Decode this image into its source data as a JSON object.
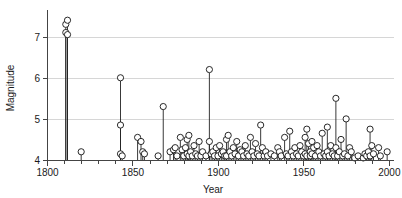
{
  "chart_data": {
    "type": "scatter",
    "plot_style": "stem-lollipop",
    "title": "",
    "xlabel": "Year",
    "ylabel": "Magnitude",
    "xlim": [
      1800,
      2003
    ],
    "ylim": [
      4,
      7.6
    ],
    "grid": "horizontal-only",
    "legend": "none",
    "baseline": 4,
    "x_ticks_major": [
      1800,
      1850,
      1900,
      1950,
      2000
    ],
    "x_ticks_major_labels": [
      "1800",
      "1850",
      "1900",
      "1950",
      "2000"
    ],
    "x_ticks_minor_step": 10,
    "y_ticks": [
      4,
      5,
      6,
      7
    ],
    "y_tick_labels": [
      "4",
      "5",
      "6",
      "7"
    ],
    "marker": "open-circle",
    "marker_size": 3.1,
    "series": [
      {
        "name": "Earthquakes",
        "points": [
          [
            1811,
            7.3
          ],
          [
            1811,
            7.1
          ],
          [
            1812,
            7.05
          ],
          [
            1812,
            7.4
          ],
          [
            1820,
            4.2
          ],
          [
            1843,
            6.0
          ],
          [
            1843,
            4.85
          ],
          [
            1843,
            4.15
          ],
          [
            1844,
            4.1
          ],
          [
            1853,
            4.55
          ],
          [
            1855,
            4.45
          ],
          [
            1856,
            4.2
          ],
          [
            1857,
            4.15
          ],
          [
            1865,
            4.1
          ],
          [
            1868,
            5.3
          ],
          [
            1872,
            4.2
          ],
          [
            1874,
            4.25
          ],
          [
            1875,
            4.3
          ],
          [
            1876,
            4.1
          ],
          [
            1878,
            4.55
          ],
          [
            1879,
            4.25
          ],
          [
            1880,
            4.1
          ],
          [
            1881,
            4.3
          ],
          [
            1882,
            4.5
          ],
          [
            1882,
            4.15
          ],
          [
            1883,
            4.6
          ],
          [
            1883,
            4.1
          ],
          [
            1884,
            4.2
          ],
          [
            1885,
            4.1
          ],
          [
            1886,
            4.35
          ],
          [
            1887,
            4.15
          ],
          [
            1888,
            4.1
          ],
          [
            1889,
            4.45
          ],
          [
            1890,
            4.1
          ],
          [
            1891,
            4.2
          ],
          [
            1893,
            4.1
          ],
          [
            1895,
            6.2
          ],
          [
            1895,
            4.45
          ],
          [
            1896,
            4.15
          ],
          [
            1897,
            4.2
          ],
          [
            1898,
            4.1
          ],
          [
            1899,
            4.3
          ],
          [
            1900,
            4.1
          ],
          [
            1901,
            4.35
          ],
          [
            1902,
            4.15
          ],
          [
            1903,
            4.2
          ],
          [
            1904,
            4.1
          ],
          [
            1905,
            4.5
          ],
          [
            1905,
            4.1
          ],
          [
            1906,
            4.6
          ],
          [
            1907,
            4.2
          ],
          [
            1908,
            4.1
          ],
          [
            1909,
            4.3
          ],
          [
            1910,
            4.15
          ],
          [
            1911,
            4.45
          ],
          [
            1912,
            4.1
          ],
          [
            1913,
            4.25
          ],
          [
            1914,
            4.2
          ],
          [
            1915,
            4.1
          ],
          [
            1916,
            4.35
          ],
          [
            1917,
            4.15
          ],
          [
            1918,
            4.1
          ],
          [
            1919,
            4.55
          ],
          [
            1920,
            4.2
          ],
          [
            1921,
            4.1
          ],
          [
            1922,
            4.4
          ],
          [
            1923,
            4.15
          ],
          [
            1924,
            4.1
          ],
          [
            1925,
            4.85
          ],
          [
            1926,
            4.3
          ],
          [
            1927,
            4.1
          ],
          [
            1928,
            4.2
          ],
          [
            1929,
            4.1
          ],
          [
            1931,
            4.15
          ],
          [
            1933,
            4.1
          ],
          [
            1935,
            4.3
          ],
          [
            1936,
            4.2
          ],
          [
            1937,
            4.1
          ],
          [
            1939,
            4.55
          ],
          [
            1940,
            4.15
          ],
          [
            1941,
            4.1
          ],
          [
            1942,
            4.7
          ],
          [
            1943,
            4.2
          ],
          [
            1944,
            4.1
          ],
          [
            1945,
            4.3
          ],
          [
            1946,
            4.15
          ],
          [
            1947,
            4.1
          ],
          [
            1948,
            4.35
          ],
          [
            1949,
            4.2
          ],
          [
            1950,
            4.1
          ],
          [
            1951,
            4.55
          ],
          [
            1951,
            4.15
          ],
          [
            1952,
            4.75
          ],
          [
            1952,
            4.1
          ],
          [
            1953,
            4.4
          ],
          [
            1954,
            4.2
          ],
          [
            1954,
            4.1
          ],
          [
            1955,
            4.45
          ],
          [
            1955,
            4.15
          ],
          [
            1956,
            4.3
          ],
          [
            1957,
            4.1
          ],
          [
            1958,
            4.35
          ],
          [
            1959,
            4.2
          ],
          [
            1960,
            4.1
          ],
          [
            1961,
            4.65
          ],
          [
            1962,
            4.15
          ],
          [
            1963,
            4.1
          ],
          [
            1964,
            4.8
          ],
          [
            1964,
            4.2
          ],
          [
            1965,
            4.1
          ],
          [
            1966,
            4.35
          ],
          [
            1967,
            4.15
          ],
          [
            1968,
            4.1
          ],
          [
            1969,
            5.5
          ],
          [
            1969,
            4.3
          ],
          [
            1970,
            4.1
          ],
          [
            1971,
            4.2
          ],
          [
            1972,
            4.5
          ],
          [
            1973,
            4.1
          ],
          [
            1974,
            4.15
          ],
          [
            1975,
            5.0
          ],
          [
            1976,
            4.1
          ],
          [
            1977,
            4.3
          ],
          [
            1978,
            4.2
          ],
          [
            1980,
            4.05
          ],
          [
            1982,
            4.1
          ],
          [
            1985,
            4.05
          ],
          [
            1986,
            4.15
          ],
          [
            1987,
            4.1
          ],
          [
            1988,
            4.2
          ],
          [
            1989,
            4.75
          ],
          [
            1989,
            4.1
          ],
          [
            1990,
            4.35
          ],
          [
            1991,
            4.15
          ],
          [
            1994,
            4.3
          ],
          [
            1995,
            4.1
          ],
          [
            1999,
            4.2
          ]
        ]
      }
    ],
    "colors": {
      "marker_stroke": "#111111",
      "marker_fill": "#ffffff",
      "stem": "#222222",
      "axis": "#444444",
      "grid": "#cccccc",
      "text": "#1a1a1a",
      "background": "#ffffff"
    }
  }
}
